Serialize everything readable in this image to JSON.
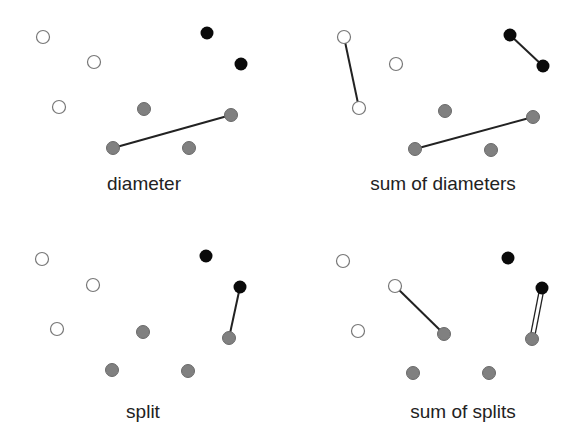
{
  "colors": {
    "white_fill": "#ffffff",
    "white_stroke": "#777777",
    "gray_fill": "#808080",
    "gray_stroke": "#6a6a6a",
    "black_fill": "#0a0a0a",
    "edge": "#222222"
  },
  "panels": [
    {
      "label": "diameter",
      "label_pos": [
        144,
        190
      ],
      "points": {
        "white": [
          [
            43,
            37
          ],
          [
            94,
            62
          ],
          [
            59,
            107
          ]
        ],
        "gray": [
          [
            144,
            109
          ],
          [
            231,
            115
          ],
          [
            113,
            148
          ],
          [
            189,
            148
          ]
        ],
        "black": [
          [
            207,
            33
          ],
          [
            241,
            64
          ]
        ]
      },
      "edges": [
        {
          "from": [
            113,
            148
          ],
          "to": [
            231,
            115
          ],
          "double": false
        }
      ]
    },
    {
      "label": "sum of diameters",
      "label_pos": [
        443,
        190
      ],
      "points": {
        "white": [
          [
            344,
            37
          ],
          [
            396,
            64
          ],
          [
            359,
            108
          ]
        ],
        "gray": [
          [
            445,
            111
          ],
          [
            533,
            117
          ],
          [
            415,
            149
          ],
          [
            491,
            150
          ]
        ],
        "black": [
          [
            510,
            35
          ],
          [
            543,
            66
          ]
        ]
      },
      "edges": [
        {
          "from": [
            344,
            37
          ],
          "to": [
            359,
            108
          ],
          "double": false
        },
        {
          "from": [
            510,
            35
          ],
          "to": [
            543,
            66
          ],
          "double": false
        },
        {
          "from": [
            415,
            149
          ],
          "to": [
            533,
            117
          ],
          "double": false
        }
      ]
    },
    {
      "label": "split",
      "label_pos": [
        143,
        418
      ],
      "points": {
        "white": [
          [
            42,
            259
          ],
          [
            93,
            285
          ],
          [
            57,
            329
          ]
        ],
        "gray": [
          [
            143,
            332
          ],
          [
            229,
            338
          ],
          [
            112,
            370
          ],
          [
            188,
            371
          ]
        ],
        "black": [
          [
            206,
            256
          ],
          [
            240,
            287
          ]
        ]
      },
      "edges": [
        {
          "from": [
            240,
            287
          ],
          "to": [
            229,
            338
          ],
          "double": false
        }
      ]
    },
    {
      "label": "sum of splits",
      "label_pos": [
        463,
        418
      ],
      "points": {
        "white": [
          [
            343,
            261
          ],
          [
            395,
            286
          ],
          [
            358,
            331
          ]
        ],
        "gray": [
          [
            444,
            334
          ],
          [
            532,
            339
          ],
          [
            413,
            373
          ],
          [
            489,
            373
          ]
        ],
        "black": [
          [
            508,
            258
          ],
          [
            542,
            288
          ]
        ]
      },
      "edges": [
        {
          "from": [
            395,
            286
          ],
          "to": [
            444,
            334
          ],
          "double": false
        },
        {
          "from": [
            542,
            288
          ],
          "to": [
            532,
            339
          ],
          "double": true
        }
      ]
    }
  ]
}
